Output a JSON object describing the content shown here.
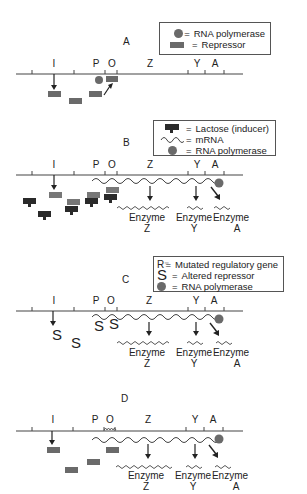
{
  "figure": {
    "colors": {
      "line": "#444444",
      "repressor": "#6a6a6a",
      "lactose": "#2a2a2a",
      "polymerase": "#6a6a6a",
      "text": "#222222"
    }
  },
  "gene_labels": [
    "I",
    "P",
    "O",
    "Z",
    "Y",
    "A"
  ],
  "panels": [
    {
      "id": "A",
      "letter": "A",
      "legend": [
        {
          "symbol": "polymerase-icon",
          "eq": "=",
          "label": "RNA polymerase"
        },
        {
          "symbol": "repressor-icon",
          "eq": "=",
          "label": "Repressor"
        }
      ]
    },
    {
      "id": "B",
      "letter": "B",
      "legend": [
        {
          "symbol": "lactose-icon",
          "eq": "=",
          "label": "Lactose (inducer)"
        },
        {
          "symbol": "mrna-icon",
          "eq": "=",
          "label": "mRNA"
        },
        {
          "symbol": "polymerase-icon",
          "eq": "=",
          "label": "RNA polymerase"
        }
      ],
      "enzymes": [
        {
          "word": "Enzyme",
          "gene": "Z"
        },
        {
          "word": "Enzyme",
          "gene": "Y"
        },
        {
          "word": "Enzyme",
          "gene": "A"
        }
      ]
    },
    {
      "id": "C",
      "letter": "C",
      "legend": [
        {
          "symbol": "R⁻",
          "eq": "=",
          "label": "Mutated regulatory gene"
        },
        {
          "symbol": "S",
          "eq": "=",
          "label": "Altered repressor"
        },
        {
          "symbol": "polymerase-icon",
          "eq": "=",
          "label": "RNA polymerase"
        }
      ],
      "altered_repressor_glyph": "S",
      "enzymes": [
        {
          "word": "Enzyme",
          "gene": "Z"
        },
        {
          "word": "Enzyme",
          "gene": "Y"
        },
        {
          "word": "Enzyme",
          "gene": "A"
        }
      ]
    },
    {
      "id": "D",
      "letter": "D",
      "enzymes": [
        {
          "word": "Enzyme",
          "gene": "Z"
        },
        {
          "word": "Enzyme",
          "gene": "Y"
        },
        {
          "word": "Enzyme",
          "gene": "A"
        }
      ]
    }
  ]
}
